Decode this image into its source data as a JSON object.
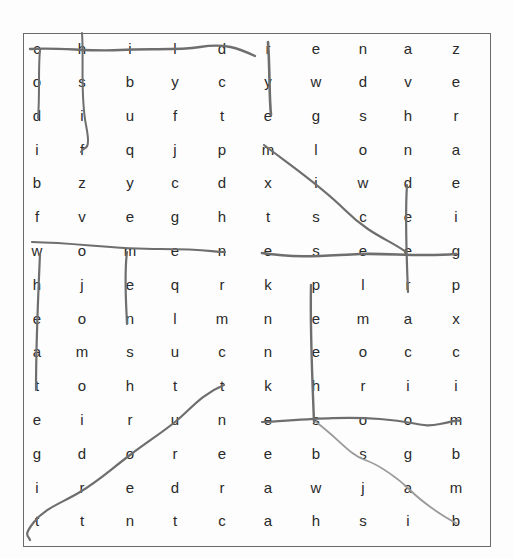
{
  "puzzle": {
    "type": "word-search",
    "rows": 15,
    "columns": 10,
    "grid": [
      [
        "c",
        "h",
        "i",
        "l",
        "d",
        "r",
        "e",
        "n",
        "a",
        "z"
      ],
      [
        "o",
        "s",
        "b",
        "y",
        "c",
        "y",
        "w",
        "d",
        "v",
        "e"
      ],
      [
        "d",
        "i",
        "u",
        "f",
        "t",
        "e",
        "g",
        "s",
        "h",
        "r"
      ],
      [
        "i",
        "f",
        "q",
        "j",
        "p",
        "m",
        "l",
        "o",
        "n",
        "a"
      ],
      [
        "b",
        "z",
        "y",
        "c",
        "d",
        "x",
        "i",
        "w",
        "d",
        "e"
      ],
      [
        "f",
        "v",
        "e",
        "g",
        "h",
        "t",
        "s",
        "c",
        "e",
        "i"
      ],
      [
        "w",
        "o",
        "m",
        "e",
        "n",
        "e",
        "s",
        "e",
        "e",
        "g"
      ],
      [
        "h",
        "j",
        "e",
        "q",
        "r",
        "k",
        "p",
        "l",
        "r",
        "p"
      ],
      [
        "e",
        "o",
        "n",
        "l",
        "m",
        "n",
        "e",
        "m",
        "a",
        "x"
      ],
      [
        "a",
        "m",
        "s",
        "u",
        "c",
        "n",
        "e",
        "o",
        "c",
        "c"
      ],
      [
        "t",
        "o",
        "h",
        "t",
        "t",
        "k",
        "h",
        "r",
        "i",
        "i"
      ],
      [
        "e",
        "i",
        "r",
        "u",
        "n",
        "e",
        "s",
        "o",
        "o",
        "m"
      ],
      [
        "g",
        "d",
        "o",
        "r",
        "e",
        "e",
        "b",
        "s",
        "g",
        "b"
      ],
      [
        "i",
        "r",
        "e",
        "d",
        "r",
        "a",
        "w",
        "j",
        "a",
        "m"
      ],
      [
        "t",
        "t",
        "n",
        "t",
        "c",
        "a",
        "h",
        "s",
        "i",
        "b"
      ]
    ],
    "column_x": [
      37,
      82,
      130,
      175,
      222,
      268,
      316,
      363,
      408,
      456
    ],
    "row_y": [
      50,
      83,
      117,
      151,
      184,
      218,
      252,
      286,
      320,
      353,
      387,
      421,
      455,
      489,
      522
    ],
    "found_words": [
      {
        "word": "children",
        "direction": "horizontal",
        "from": [
          1,
          1
        ],
        "to": [
          1,
          8
        ]
      },
      {
        "word": "cod",
        "direction": "vertical",
        "from": [
          1,
          1
        ],
        "to": [
          3,
          1
        ]
      },
      {
        "word": "hsif",
        "direction": "vertical",
        "from": [
          1,
          2
        ],
        "to": [
          4,
          2
        ]
      },
      {
        "word": "rye",
        "direction": "vertical",
        "from": [
          1,
          6
        ],
        "to": [
          3,
          6
        ]
      },
      {
        "word": "mice",
        "direction": "diagonal",
        "from": [
          4,
          6
        ],
        "to": [
          7,
          9
        ]
      },
      {
        "word": "deer",
        "direction": "vertical",
        "from": [
          5,
          9
        ],
        "to": [
          8,
          9
        ]
      },
      {
        "word": "women",
        "direction": "horizontal",
        "from": [
          7,
          1
        ],
        "to": [
          7,
          5
        ]
      },
      {
        "word": "eseeg",
        "direction": "horizontal",
        "from": [
          7,
          6
        ],
        "to": [
          7,
          10
        ]
      },
      {
        "word": "wheat",
        "direction": "vertical",
        "from": [
          7,
          1
        ],
        "to": [
          11,
          1
        ]
      },
      {
        "word": "men",
        "direction": "vertical",
        "from": [
          7,
          3
        ],
        "to": [
          9,
          3
        ]
      },
      {
        "word": "peehs",
        "direction": "vertical",
        "from": [
          8,
          7
        ],
        "to": [
          12,
          7
        ]
      },
      {
        "word": "esoom",
        "direction": "horizontal",
        "from": [
          12,
          6
        ],
        "to": [
          12,
          10
        ]
      },
      {
        "word": "ssab",
        "direction": "diagonal",
        "from": [
          12,
          7
        ],
        "to": [
          15,
          10
        ]
      },
      {
        "word": "tuort",
        "direction": "diagonal",
        "from": [
          11,
          5
        ],
        "to": [
          15,
          1
        ]
      }
    ]
  },
  "colors": {
    "letter": "#2a2a2a",
    "frame": "#6b6b6b",
    "stroke_dark": "#6e6e6e",
    "stroke_light": "#9a9a9a",
    "background": "#fdfdfd"
  }
}
